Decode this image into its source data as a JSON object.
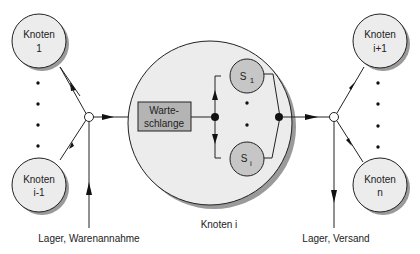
{
  "diagram": {
    "colors": {
      "node_fill": "#ececec",
      "station_fill": "#f0f0f0",
      "queue_fill": "#b4b4b4",
      "server_fill": "#c6c6c6",
      "shadow": "#9a9a9a",
      "stroke": "#222222"
    },
    "nodes": {
      "knoten_1": {
        "line1": "Knoten",
        "line2": "1"
      },
      "knoten_i_minus_1": {
        "line1": "Knoten",
        "line2": "i-1"
      },
      "knoten_i_plus_1": {
        "line1": "Knoten",
        "line2": "i+1"
      },
      "knoten_n": {
        "line1": "Knoten",
        "line2": "n"
      }
    },
    "station": {
      "label": "Knoten i",
      "queue": {
        "line1": "Warte-",
        "line2": "schlange"
      },
      "servers": [
        {
          "base": "S",
          "sub": "1"
        },
        {
          "base": "S",
          "sub": "i"
        }
      ]
    },
    "inputs": {
      "source_label": "Lager, Warenannahme"
    },
    "outputs": {
      "sink_label": "Lager, Versand"
    }
  }
}
